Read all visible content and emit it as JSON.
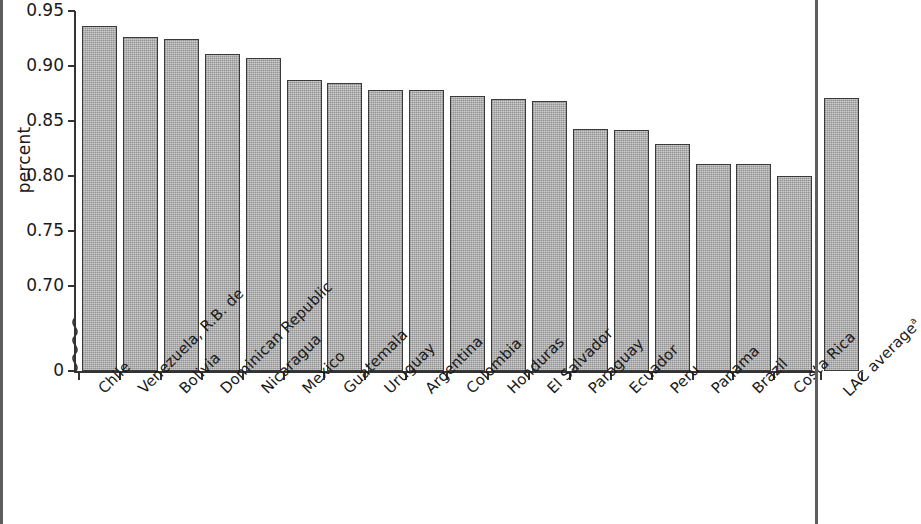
{
  "chart_data": {
    "type": "bar",
    "title": "",
    "subtitle": "",
    "xlabel": "",
    "ylabel": "percent",
    "ylim": [
      0.7,
      0.95
    ],
    "y_axis_broken": true,
    "y_break_from": 0,
    "y_break_to": 0.7,
    "grid": false,
    "legend": "none",
    "y_tick_labels": [
      "0.95",
      "0.90",
      "0.85",
      "0.80",
      "0.75",
      "0.70",
      "0"
    ],
    "y_tick_values": [
      0.95,
      0.9,
      0.85,
      0.8,
      0.75,
      0.7,
      0
    ],
    "bar_color": "#a6a6a6",
    "bar_edge_color": "#3a3a3a",
    "categories": [
      "Chile",
      "Venezuela, R.B. de",
      "Bolivia",
      "Dominican Republic",
      "Nicaragua",
      "Mexico",
      "Guatemala",
      "Uruguay",
      "Argentina",
      "Colombia",
      "Honduras",
      "El Salvador",
      "Paraguay",
      "Ecuador",
      "Peru",
      "Panama",
      "Brazil",
      "Costa Rica",
      "LAC average"
    ],
    "category_superscripts": [
      "",
      "",
      "",
      "",
      "",
      "",
      "",
      "",
      "",
      "",
      "",
      "",
      "",
      "",
      "",
      "",
      "",
      "",
      "a"
    ],
    "values": [
      0.936,
      0.926,
      0.925,
      0.911,
      0.907,
      0.887,
      0.885,
      0.878,
      0.878,
      0.873,
      0.87,
      0.868,
      0.843,
      0.842,
      0.829,
      0.811,
      0.811,
      0.8,
      0.871
    ],
    "gap_before_last_bar": true
  }
}
